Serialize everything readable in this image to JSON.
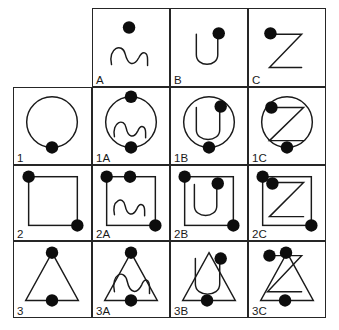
{
  "figure": {
    "background_color": "#ffffff",
    "line_color": "#1a1a1a",
    "dot_color": "#0d0d0d",
    "grid": {
      "rows": 4,
      "columns": 4,
      "top_left_cell": "empty"
    }
  },
  "column_headers": [
    {
      "label": "A",
      "shape": "s-squiggle-glyph"
    },
    {
      "label": "B",
      "shape": "u-glyph"
    },
    {
      "label": "C",
      "shape": "z-glyph"
    }
  ],
  "row_headers": [
    {
      "label": "1",
      "shape": "circle"
    },
    {
      "label": "2",
      "shape": "square"
    },
    {
      "label": "3",
      "shape": "triangle"
    }
  ],
  "cells": [
    {
      "id": "header-a",
      "label": "A",
      "row": 0,
      "col": 1,
      "shapes": [
        "s-squiggle-glyph"
      ],
      "dots": 1,
      "dot_positions": [
        "top-center"
      ]
    },
    {
      "id": "header-b",
      "label": "B",
      "row": 0,
      "col": 2,
      "shapes": [
        "u-glyph"
      ],
      "dots": 1,
      "dot_positions": [
        "top-right"
      ]
    },
    {
      "id": "header-c",
      "label": "C",
      "row": 0,
      "col": 3,
      "shapes": [
        "z-glyph"
      ],
      "dots": 1,
      "dot_positions": [
        "top-left"
      ]
    },
    {
      "id": "row-1",
      "label": "1",
      "row": 1,
      "col": 0,
      "shapes": [
        "circle"
      ],
      "dots": 1,
      "dot_positions": [
        "bottom-center"
      ]
    },
    {
      "id": "cell-1a",
      "label": "1A",
      "row": 1,
      "col": 1,
      "shapes": [
        "circle",
        "s-squiggle-glyph"
      ],
      "dots": 2,
      "dot_positions": [
        "top-center",
        "bottom-center"
      ]
    },
    {
      "id": "cell-1b",
      "label": "1B",
      "row": 1,
      "col": 2,
      "shapes": [
        "circle",
        "u-glyph"
      ],
      "dots": 2,
      "dot_positions": [
        "top-right",
        "bottom-center"
      ]
    },
    {
      "id": "cell-1c",
      "label": "1C",
      "row": 1,
      "col": 3,
      "shapes": [
        "circle",
        "z-glyph"
      ],
      "dots": 2,
      "dot_positions": [
        "top-left",
        "bottom-center"
      ]
    },
    {
      "id": "row-2",
      "label": "2",
      "row": 2,
      "col": 0,
      "shapes": [
        "square"
      ],
      "dots": 2,
      "dot_positions": [
        "top-left",
        "bottom-right"
      ]
    },
    {
      "id": "cell-2a",
      "label": "2A",
      "row": 2,
      "col": 1,
      "shapes": [
        "square",
        "s-squiggle-glyph"
      ],
      "dots": 3,
      "dot_positions": [
        "top-left",
        "top-center",
        "bottom-right"
      ]
    },
    {
      "id": "cell-2b",
      "label": "2B",
      "row": 2,
      "col": 2,
      "shapes": [
        "square",
        "u-glyph"
      ],
      "dots": 3,
      "dot_positions": [
        "top-left",
        "top-right",
        "bottom-right"
      ]
    },
    {
      "id": "cell-2c",
      "label": "2C",
      "row": 2,
      "col": 3,
      "shapes": [
        "square",
        "z-glyph"
      ],
      "dots": 3,
      "dot_positions": [
        "top-left",
        "upper-left-inner",
        "bottom-right"
      ]
    },
    {
      "id": "row-3",
      "label": "3",
      "row": 3,
      "col": 0,
      "shapes": [
        "triangle"
      ],
      "dots": 2,
      "dot_positions": [
        "apex",
        "bottom-center"
      ]
    },
    {
      "id": "cell-3a",
      "label": "3A",
      "row": 3,
      "col": 1,
      "shapes": [
        "triangle",
        "s-squiggle-glyph"
      ],
      "dots": 2,
      "dot_positions": [
        "apex",
        "bottom-center"
      ]
    },
    {
      "id": "cell-3b",
      "label": "3B",
      "row": 3,
      "col": 2,
      "shapes": [
        "triangle",
        "u-glyph"
      ],
      "dots": 2,
      "dot_positions": [
        "upper-right",
        "bottom-center"
      ]
    },
    {
      "id": "cell-3c",
      "label": "3C",
      "row": 3,
      "col": 3,
      "shapes": [
        "triangle",
        "z-glyph"
      ],
      "dots": 3,
      "dot_positions": [
        "apex-left",
        "apex",
        "bottom-center"
      ]
    }
  ]
}
